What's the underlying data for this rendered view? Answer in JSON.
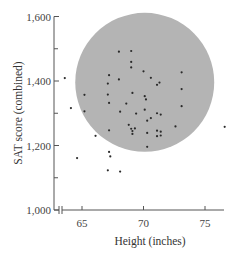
{
  "chart_data": {
    "type": "scatter",
    "title": "",
    "xlabel": "Height (inches)",
    "ylabel": "SAT score (combined)",
    "xlim": [
      63.5,
      77
    ],
    "ylim": [
      1000,
      1600
    ],
    "x_ticks": [
      65,
      70,
      75
    ],
    "x_tick_labels": [
      "65",
      "70",
      "75"
    ],
    "y_ticks": [
      1000,
      1200,
      1400,
      1600
    ],
    "y_tick_labels": [
      "1,000",
      "1,200",
      "1,400",
      "1,600"
    ],
    "y_minor_ticks": [
      1100,
      1300,
      1500
    ],
    "x_axis_break": true,
    "grid": false,
    "legend": null,
    "annotations": [
      {
        "type": "shaded-circle",
        "description": "gray circle enclosing the bulk of the points",
        "center": [
          70.1,
          1396
        ],
        "radius_inches": 5.65,
        "color": "#b4b4b4"
      }
    ],
    "colors": {
      "circle": "#b4b4b4",
      "points": "#2a2a2a",
      "axis": "#555555"
    },
    "points": [
      {
        "x": 68.0,
        "y": 1491
      },
      {
        "x": 69.0,
        "y": 1493
      },
      {
        "x": 69.0,
        "y": 1459
      },
      {
        "x": 69.0,
        "y": 1442
      },
      {
        "x": 70.0,
        "y": 1430
      },
      {
        "x": 73.1,
        "y": 1427
      },
      {
        "x": 67.2,
        "y": 1418
      },
      {
        "x": 68.0,
        "y": 1405
      },
      {
        "x": 70.6,
        "y": 1410
      },
      {
        "x": 71.3,
        "y": 1395
      },
      {
        "x": 71.1,
        "y": 1388
      },
      {
        "x": 67.1,
        "y": 1392
      },
      {
        "x": 73.1,
        "y": 1375
      },
      {
        "x": 65.2,
        "y": 1357
      },
      {
        "x": 67.1,
        "y": 1358
      },
      {
        "x": 69.1,
        "y": 1363
      },
      {
        "x": 70.1,
        "y": 1353
      },
      {
        "x": 70.2,
        "y": 1343
      },
      {
        "x": 73.1,
        "y": 1322
      },
      {
        "x": 67.2,
        "y": 1332
      },
      {
        "x": 68.6,
        "y": 1330
      },
      {
        "x": 64.1,
        "y": 1316
      },
      {
        "x": 65.2,
        "y": 1306
      },
      {
        "x": 68.1,
        "y": 1305
      },
      {
        "x": 70.1,
        "y": 1311
      },
      {
        "x": 69.4,
        "y": 1299
      },
      {
        "x": 71.1,
        "y": 1300
      },
      {
        "x": 71.4,
        "y": 1296
      },
      {
        "x": 70.6,
        "y": 1285
      },
      {
        "x": 70.3,
        "y": 1277
      },
      {
        "x": 72.6,
        "y": 1259
      },
      {
        "x": 68.8,
        "y": 1264
      },
      {
        "x": 69.0,
        "y": 1252
      },
      {
        "x": 69.3,
        "y": 1253
      },
      {
        "x": 69.1,
        "y": 1245
      },
      {
        "x": 69.1,
        "y": 1236
      },
      {
        "x": 67.2,
        "y": 1247
      },
      {
        "x": 71.1,
        "y": 1246
      },
      {
        "x": 71.4,
        "y": 1243
      },
      {
        "x": 70.3,
        "y": 1239
      },
      {
        "x": 71.1,
        "y": 1229
      },
      {
        "x": 71.4,
        "y": 1231
      },
      {
        "x": 66.1,
        "y": 1230
      },
      {
        "x": 70.3,
        "y": 1196
      },
      {
        "x": 67.2,
        "y": 1180
      },
      {
        "x": 67.3,
        "y": 1166
      },
      {
        "x": 67.1,
        "y": 1123
      },
      {
        "x": 68.1,
        "y": 1119
      },
      {
        "x": 64.6,
        "y": 1161
      },
      {
        "x": 63.6,
        "y": 1409
      },
      {
        "x": 76.6,
        "y": 1258
      }
    ]
  }
}
